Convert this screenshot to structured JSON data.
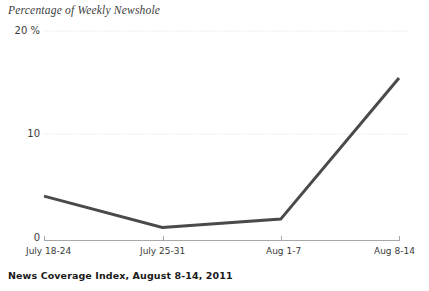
{
  "chart_data": {
    "type": "line",
    "title": "Percentage of Weekly Newshole",
    "xlabel": "",
    "ylabel": "",
    "categories": [
      "July 18-24",
      "July 25-31",
      "Aug 1-7",
      "Aug 8-14"
    ],
    "values": [
      4.2,
      1.2,
      2.0,
      15.5
    ],
    "series": [
      {
        "name": "Percentage of Weekly Newshole",
        "values": [
          4.2,
          1.2,
          2.0,
          15.5
        ]
      }
    ],
    "ylim": [
      0,
      20
    ],
    "yticks": [
      0,
      10,
      20
    ],
    "ytick_labels": [
      "0",
      "10",
      "20 %"
    ],
    "xtick_labels": [
      "July 18-24",
      "July 25-31",
      "Aug 1-7",
      "Aug 8-14"
    ],
    "grid": true,
    "gridlines_y": [
      10,
      20
    ],
    "legend": null,
    "legend_position": "none",
    "line_color": "#4a4a4a",
    "grid_color": "#e2e2e2",
    "axis_color": "#9a9a9a",
    "footer": "News Coverage Index,  August  8-14,  2011"
  },
  "footer": {
    "source_note": "News Coverage Index,  August  8-14,  2011"
  }
}
